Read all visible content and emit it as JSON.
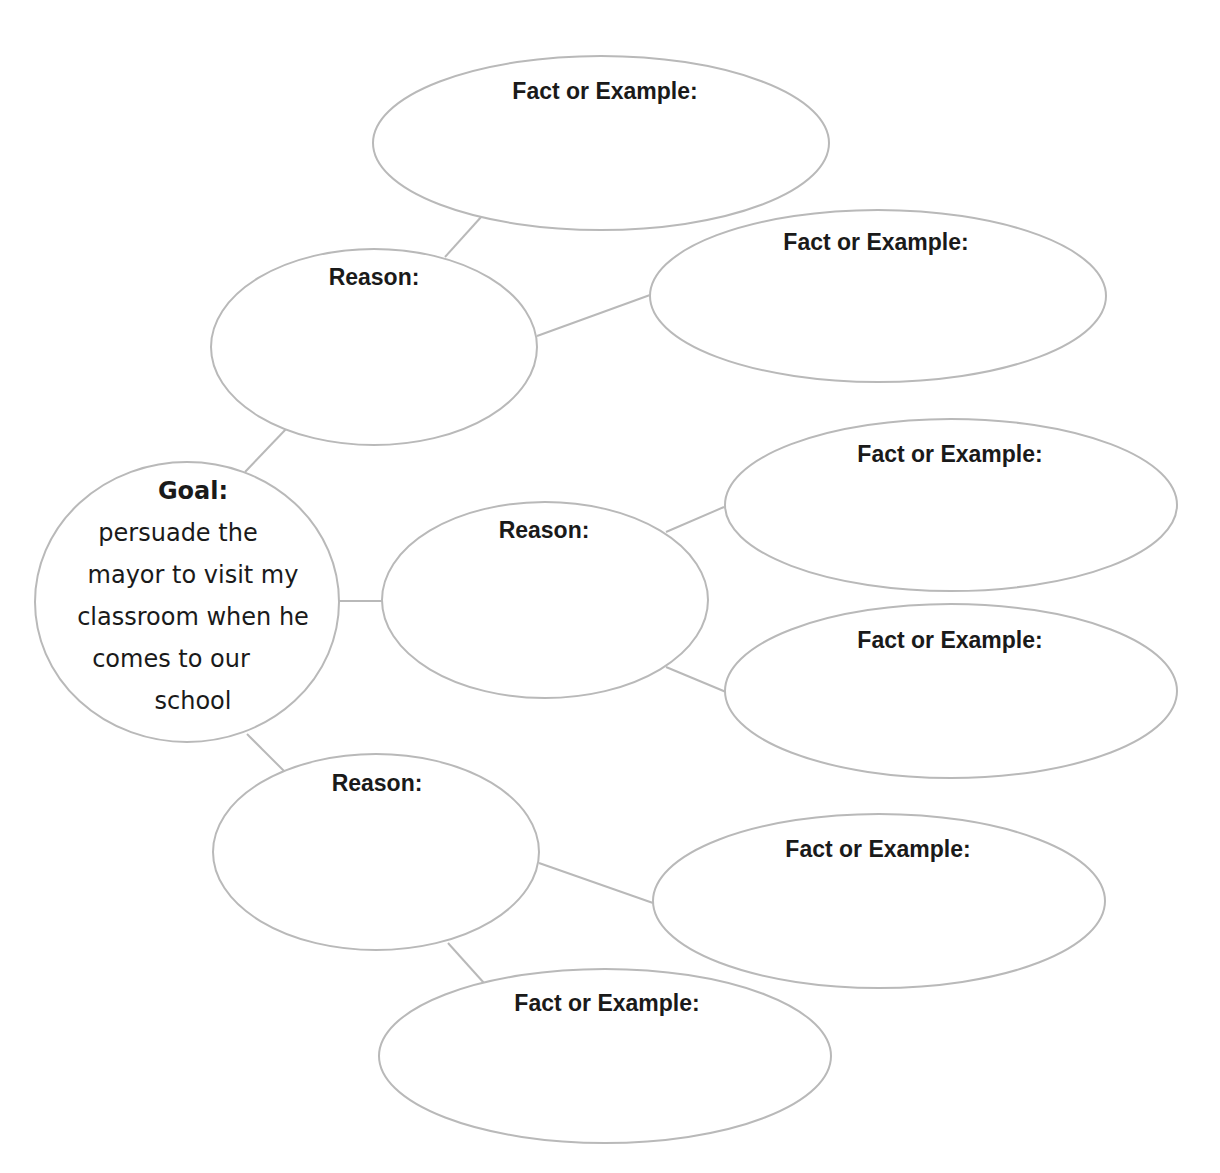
{
  "diagram": {
    "type": "persuasion-map",
    "goal": {
      "heading": "Goal:",
      "lines": [
        "persuade the",
        "mayor to visit my",
        "classroom when he",
        "comes to our",
        "school"
      ],
      "full_text": "persuade the mayor to visit my classroom when he comes to our school"
    },
    "reasons": [
      {
        "label": "Reason:",
        "facts": [
          {
            "label": "Fact or Example:"
          },
          {
            "label": "Fact or Example:"
          }
        ]
      },
      {
        "label": "Reason:",
        "facts": [
          {
            "label": "Fact or Example:"
          },
          {
            "label": "Fact or Example:"
          }
        ]
      },
      {
        "label": "Reason:",
        "facts": [
          {
            "label": "Fact or Example:"
          },
          {
            "label": "Fact or Example:"
          }
        ]
      }
    ],
    "colors": {
      "outline": "#b9b9b9",
      "text": "#1a1a1a",
      "background": "#ffffff"
    }
  }
}
